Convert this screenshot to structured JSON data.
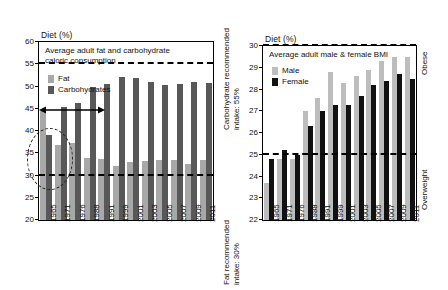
{
  "figure": {
    "background": "#ffffff",
    "width": 448,
    "height": 290
  },
  "panels": {
    "left": {
      "axis_title": "Diet (%)",
      "caption": "Average adult fat and carbohydrate\ncaloric consumption",
      "legend": [
        {
          "label": "Fat",
          "color": "#a8a8a8"
        },
        {
          "label": "Carbohydrates",
          "color": "#585858"
        }
      ],
      "side_label": "Carbohydrate recommended\nintake: 55%",
      "side_label_lower": "Fat recommended\nintake: 30%",
      "yticks": [
        20,
        25,
        30,
        35,
        40,
        45,
        50,
        55,
        60
      ],
      "reflines": [
        {
          "value": 55,
          "meaning": "carbohydrate-recommended-intake"
        },
        {
          "value": 30,
          "meaning": "fat-recommended-intake"
        }
      ],
      "annotation_arrow_value": 46.3,
      "annotation_ellipse_label": "1965-highlight"
    },
    "right": {
      "axis_title": "Diet (%)",
      "caption": "Average adult male & female BMI",
      "legend": [
        {
          "label": "Male",
          "color": "#bdbdbd"
        },
        {
          "label": "Female",
          "color": "#111111"
        }
      ],
      "yticks": [
        22,
        23,
        24,
        25,
        26,
        27,
        28,
        29,
        30
      ],
      "reflines": [
        {
          "value": 30,
          "label": "Obese"
        },
        {
          "value": 25,
          "label": "Overweight"
        }
      ],
      "edge_labels": {
        "top": "Obese",
        "middle": "Overweight"
      }
    }
  },
  "chart_data": [
    {
      "type": "bar",
      "id": "diet-fat-carbohydrate",
      "title": "Average adult fat and carbohydrate caloric consumption",
      "xlabel": "",
      "ylabel": "Diet (%)",
      "ylim": [
        20,
        60
      ],
      "yticks": [
        20,
        25,
        30,
        35,
        40,
        45,
        50,
        55,
        60
      ],
      "grid": false,
      "legend_position": "inside-top-left",
      "categories": [
        "1965",
        "1971",
        "1976",
        "1988",
        "1991",
        "1999",
        "2001",
        "2003",
        "2005",
        "2007",
        "2009",
        "2011"
      ],
      "series": [
        {
          "name": "Fat",
          "color": "#a8a8a8",
          "values": [
            44.6,
            36.8,
            37.3,
            34.0,
            33.6,
            32.2,
            33.0,
            33.3,
            33.5,
            33.4,
            32.5,
            33.4
          ]
        },
        {
          "name": "Carbohydrates",
          "color": "#585858",
          "values": [
            39.2,
            45.5,
            46.2,
            50.0,
            50.6,
            52.2,
            52.0,
            51.0,
            50.4,
            50.6,
            51.0,
            50.7
          ]
        }
      ],
      "reference_lines": [
        {
          "value": 55,
          "style": "dashed",
          "label": "Carbohydrate recommended intake: 55%"
        },
        {
          "value": 30,
          "style": "dashed",
          "label": "Fat recommended intake: 30%"
        }
      ],
      "annotations": [
        {
          "type": "ellipse",
          "target": "1965 fat & carbohydrate bars",
          "style": "dashed"
        },
        {
          "type": "double-arrow",
          "value": 46.3,
          "span": "1965 to 1976"
        }
      ]
    },
    {
      "type": "bar",
      "id": "adult-bmi-male-female",
      "title": "Average adult male & female BMI",
      "xlabel": "",
      "ylabel": "Diet (%)",
      "ylim": [
        22,
        30
      ],
      "yticks": [
        22,
        23,
        24,
        25,
        26,
        27,
        28,
        29,
        30
      ],
      "grid": false,
      "legend_position": "inside-top-left",
      "categories": [
        "1965",
        "1971",
        "1976",
        "1988",
        "1991",
        "1999",
        "2001",
        "2003",
        "2005",
        "2007",
        "2009",
        "2011"
      ],
      "series": [
        {
          "name": "Male",
          "color": "#bdbdbd",
          "values": [
            23.7,
            24.8,
            24.8,
            27.0,
            27.6,
            28.8,
            28.3,
            28.6,
            28.9,
            29.3,
            29.5,
            29.5
          ]
        },
        {
          "name": "Female",
          "color": "#111111",
          "values": [
            24.8,
            25.2,
            25.0,
            26.3,
            27.0,
            27.3,
            27.3,
            27.7,
            28.2,
            28.4,
            28.7,
            28.5
          ]
        }
      ],
      "reference_lines": [
        {
          "value": 30,
          "style": "dashed",
          "label": "Obese"
        },
        {
          "value": 25,
          "style": "dashed",
          "label": "Overweight"
        }
      ]
    }
  ]
}
